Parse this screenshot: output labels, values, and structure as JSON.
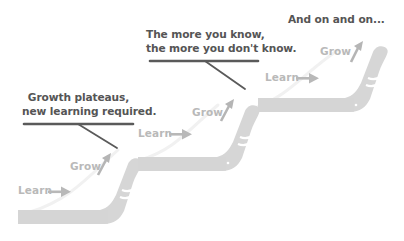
{
  "diagram": {
    "colors": {
      "stick": "#d6d6d6",
      "stick_stripe": "#ffffff",
      "label": "#b9b9b9",
      "arrow": "#b5b5b5",
      "callout_text": "#555555",
      "callout_line": "#5a5a5a",
      "trail": "#f2f2f2"
    },
    "steps": [
      {
        "learn_label": "Learn",
        "grow_label": "Grow",
        "learn_arrow_icon": "arrow-right-icon",
        "grow_arrow_icon": "arrow-up-right-icon"
      },
      {
        "learn_label": "Learn",
        "grow_label": "Grow",
        "learn_arrow_icon": "arrow-right-icon",
        "grow_arrow_icon": "arrow-up-right-icon"
      },
      {
        "learn_label": "Learn",
        "grow_label": "Grow",
        "learn_arrow_icon": "arrow-right-icon",
        "grow_arrow_icon": "arrow-up-right-icon"
      }
    ],
    "callouts": [
      {
        "line1": "Growth plateaus,",
        "line2": "new learning required."
      },
      {
        "line1": "The more you know,",
        "line2": "the more you don't know."
      },
      {
        "line1": "And on and on..."
      }
    ]
  }
}
